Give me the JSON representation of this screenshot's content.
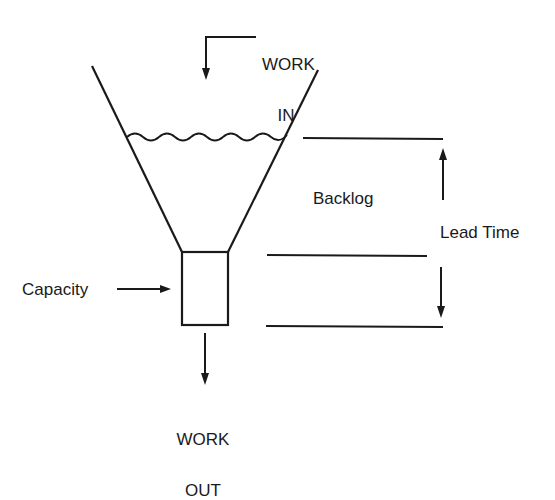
{
  "diagram": {
    "type": "funnel-flow",
    "labels": {
      "work_in_line1": "WORK",
      "work_in_line2": "IN",
      "work_out_line1": "WORK",
      "work_out_line2": "OUT",
      "capacity": "Capacity",
      "backlog": "Backlog",
      "lead_time": "Lead Time"
    },
    "colors": {
      "stroke": "#1a1a1a",
      "background": "#ffffff"
    }
  }
}
